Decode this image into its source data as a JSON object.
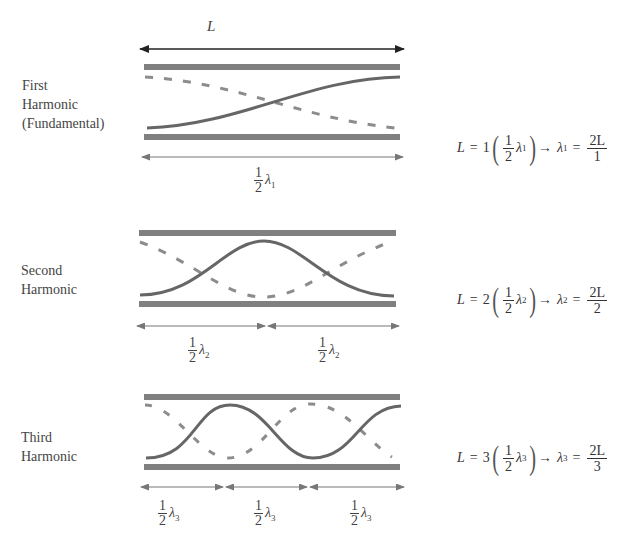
{
  "top_length_label": "L",
  "harmonics": [
    {
      "name_lines": [
        "First",
        "Harmonic",
        "(Fundamental)"
      ],
      "n": "1",
      "segments": 1,
      "segment_label": {
        "num": "1",
        "den": "2",
        "symbol": "λ",
        "sub": "1"
      },
      "equation": {
        "lhs": "L",
        "eq": "=",
        "coef": "1",
        "frac_num": "1",
        "frac_den": "2",
        "lambda": "λ",
        "sub": "1",
        "arrow": "→",
        "rhs_lambda": "λ",
        "rhs_sub": "1",
        "rhs_eq": "=",
        "rhs_num": "2L",
        "rhs_den": "1"
      }
    },
    {
      "name_lines": [
        "Second",
        "Harmonic"
      ],
      "n": "2",
      "segments": 2,
      "segment_label": {
        "num": "1",
        "den": "2",
        "symbol": "λ",
        "sub": "2"
      },
      "equation": {
        "lhs": "L",
        "eq": "=",
        "coef": "2",
        "frac_num": "1",
        "frac_den": "2",
        "lambda": "λ",
        "sub": "2",
        "arrow": "→",
        "rhs_lambda": "λ",
        "rhs_sub": "2",
        "rhs_eq": "=",
        "rhs_num": "2L",
        "rhs_den": "2"
      }
    },
    {
      "name_lines": [
        "Third",
        "Harmonic"
      ],
      "n": "3",
      "segments": 3,
      "segment_label": {
        "num": "1",
        "den": "2",
        "symbol": "λ",
        "sub": "3"
      },
      "equation": {
        "lhs": "L",
        "eq": "=",
        "coef": "3",
        "frac_num": "1",
        "frac_den": "2",
        "lambda": "λ",
        "sub": "3",
        "arrow": "→",
        "rhs_lambda": "λ",
        "rhs_sub": "3",
        "rhs_eq": "=",
        "rhs_num": "2L",
        "rhs_den": "3"
      }
    }
  ],
  "colors": {
    "wall": "#808080",
    "wave_solid": "#666666",
    "wave_dashed": "#8c8c8c",
    "arrow_top": "#222222",
    "arrow_dim": "#777777",
    "text": "#444444"
  }
}
